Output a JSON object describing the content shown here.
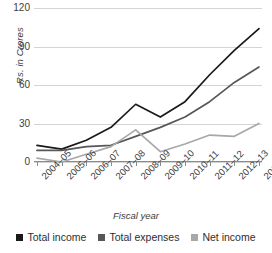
{
  "chart_data": {
    "type": "line",
    "title": "",
    "xlabel": "Fiscal year",
    "ylabel": "Rs. in Crores",
    "categories": [
      "2004–05",
      "2005–06",
      "2006–07",
      "2007–08",
      "2008–09",
      "2009–10",
      "2010–11",
      "2011–12",
      "2012–13",
      "2013–14"
    ],
    "series": [
      {
        "name": "Total income",
        "color": "#1a1a1a",
        "values": [
          13,
          10,
          17,
          27,
          45,
          35,
          47,
          68,
          87,
          104
        ]
      },
      {
        "name": "Total expenses",
        "color": "#575757",
        "values": [
          9,
          9,
          12,
          13,
          20,
          27,
          35,
          47,
          62,
          74
        ]
      },
      {
        "name": "Net income",
        "color": "#a8a8a8",
        "values": [
          3,
          0,
          6,
          12,
          25,
          8,
          14,
          21,
          20,
          30
        ]
      }
    ],
    "ylim": [
      0,
      120
    ],
    "yticks": [
      0,
      30,
      60,
      90,
      120
    ],
    "ytick_labels": [
      "0",
      "30",
      "60",
      "90",
      "120"
    ],
    "grid": true,
    "legend_position": "bottom"
  },
  "axis": {
    "y_title": "Rs. in Crores",
    "x_title": "Fiscal year"
  },
  "legend": {
    "items": [
      {
        "label": "Total income",
        "color": "#1a1a1a"
      },
      {
        "label": "Total expenses",
        "color": "#575757"
      },
      {
        "label": "Net income",
        "color": "#a8a8a8"
      }
    ]
  }
}
